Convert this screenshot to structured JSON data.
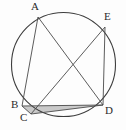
{
  "figure": {
    "background_color": "#fdfdfd",
    "stroke_color": "#4a4a4a",
    "circle_stroke_color": "#3d3d3d",
    "shade_fill_color": "#c9c9c9",
    "label_color": "#2b2b2b",
    "circle": {
      "name": "circumscribed-circle",
      "cx": 63.5,
      "cy": 64.5,
      "r": 52,
      "stroke_width": 1.1
    },
    "points": [
      {
        "id": "A",
        "label": "A",
        "x": 38,
        "y": 17,
        "label_x": 31,
        "label_y": 1
      },
      {
        "id": "E",
        "label": "E",
        "x": 105,
        "y": 27,
        "label_x": 104,
        "label_y": 11
      },
      {
        "id": "B",
        "label": "B",
        "x": 22,
        "y": 106,
        "label_x": 11,
        "label_y": 99
      },
      {
        "id": "C",
        "label": "C",
        "x": 31,
        "y": 114,
        "label_x": 20,
        "label_y": 112
      },
      {
        "id": "D",
        "label": "D",
        "x": 103,
        "y": 105,
        "label_x": 105,
        "label_y": 105
      }
    ],
    "segments": [
      {
        "name": "chord-AB",
        "from": "A",
        "to": "B",
        "x1": 38,
        "y1": 17,
        "x2": 22,
        "y2": 106
      },
      {
        "name": "chord-AD",
        "from": "A",
        "to": "D",
        "x1": 38,
        "y1": 17,
        "x2": 103,
        "y2": 105
      },
      {
        "name": "chord-EC",
        "from": "E",
        "to": "C",
        "x1": 105,
        "y1": 27,
        "x2": 31,
        "y2": 114
      },
      {
        "name": "chord-ED",
        "from": "E",
        "to": "D",
        "x1": 105,
        "y1": 27,
        "x2": 103,
        "y2": 105
      },
      {
        "name": "chord-BD",
        "from": "B",
        "to": "D",
        "x1": 22,
        "y1": 106,
        "x2": 103,
        "y2": 105
      },
      {
        "name": "chord-BC",
        "from": "B",
        "to": "C",
        "x1": 22,
        "y1": 106,
        "x2": 31,
        "y2": 114
      },
      {
        "name": "chord-CD",
        "from": "C",
        "to": "D",
        "x1": 31,
        "y1": 114,
        "x2": 103,
        "y2": 105
      }
    ],
    "shaded_region": {
      "name": "shaded-triangle-BCD",
      "vertices": [
        "B",
        "C",
        "D"
      ],
      "points": "22,106 31,114 103,105"
    }
  }
}
